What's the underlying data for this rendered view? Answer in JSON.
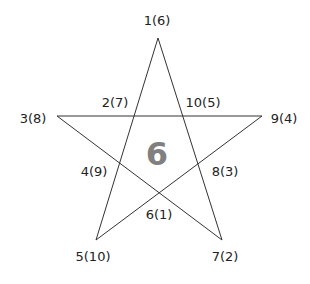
{
  "diagram": {
    "type": "pentagram",
    "center_value": "6",
    "colors": {
      "line": "#333333",
      "label": "#222222",
      "center": "#808080",
      "background": "#ffffff"
    },
    "vertices": [
      {
        "id": "top",
        "label": "1(6)",
        "x": 158,
        "y": 38,
        "label_x": 157,
        "label_y": 20
      },
      {
        "id": "left",
        "label": "3(8)",
        "x": 57,
        "y": 116,
        "label_x": 33,
        "label_y": 118
      },
      {
        "id": "right",
        "label": "9(4)",
        "x": 262,
        "y": 116,
        "label_x": 284,
        "label_y": 118
      },
      {
        "id": "bottom-left",
        "label": "5(10)",
        "x": 96,
        "y": 240,
        "label_x": 93,
        "label_y": 256
      },
      {
        "id": "bottom-right",
        "label": "7(2)",
        "x": 222,
        "y": 240,
        "label_x": 225,
        "label_y": 256
      }
    ],
    "intersections": [
      {
        "id": "upper-left",
        "label": "2(7)",
        "label_x": 115,
        "label_y": 102
      },
      {
        "id": "upper-right",
        "label": "10(5)",
        "label_x": 203,
        "label_y": 102
      },
      {
        "id": "lower-left",
        "label": "4(9)",
        "label_x": 94,
        "label_y": 171
      },
      {
        "id": "lower-right",
        "label": "8(3)",
        "label_x": 225,
        "label_y": 171
      },
      {
        "id": "bottom",
        "label": "6(1)",
        "label_x": 159,
        "label_y": 214
      }
    ]
  }
}
